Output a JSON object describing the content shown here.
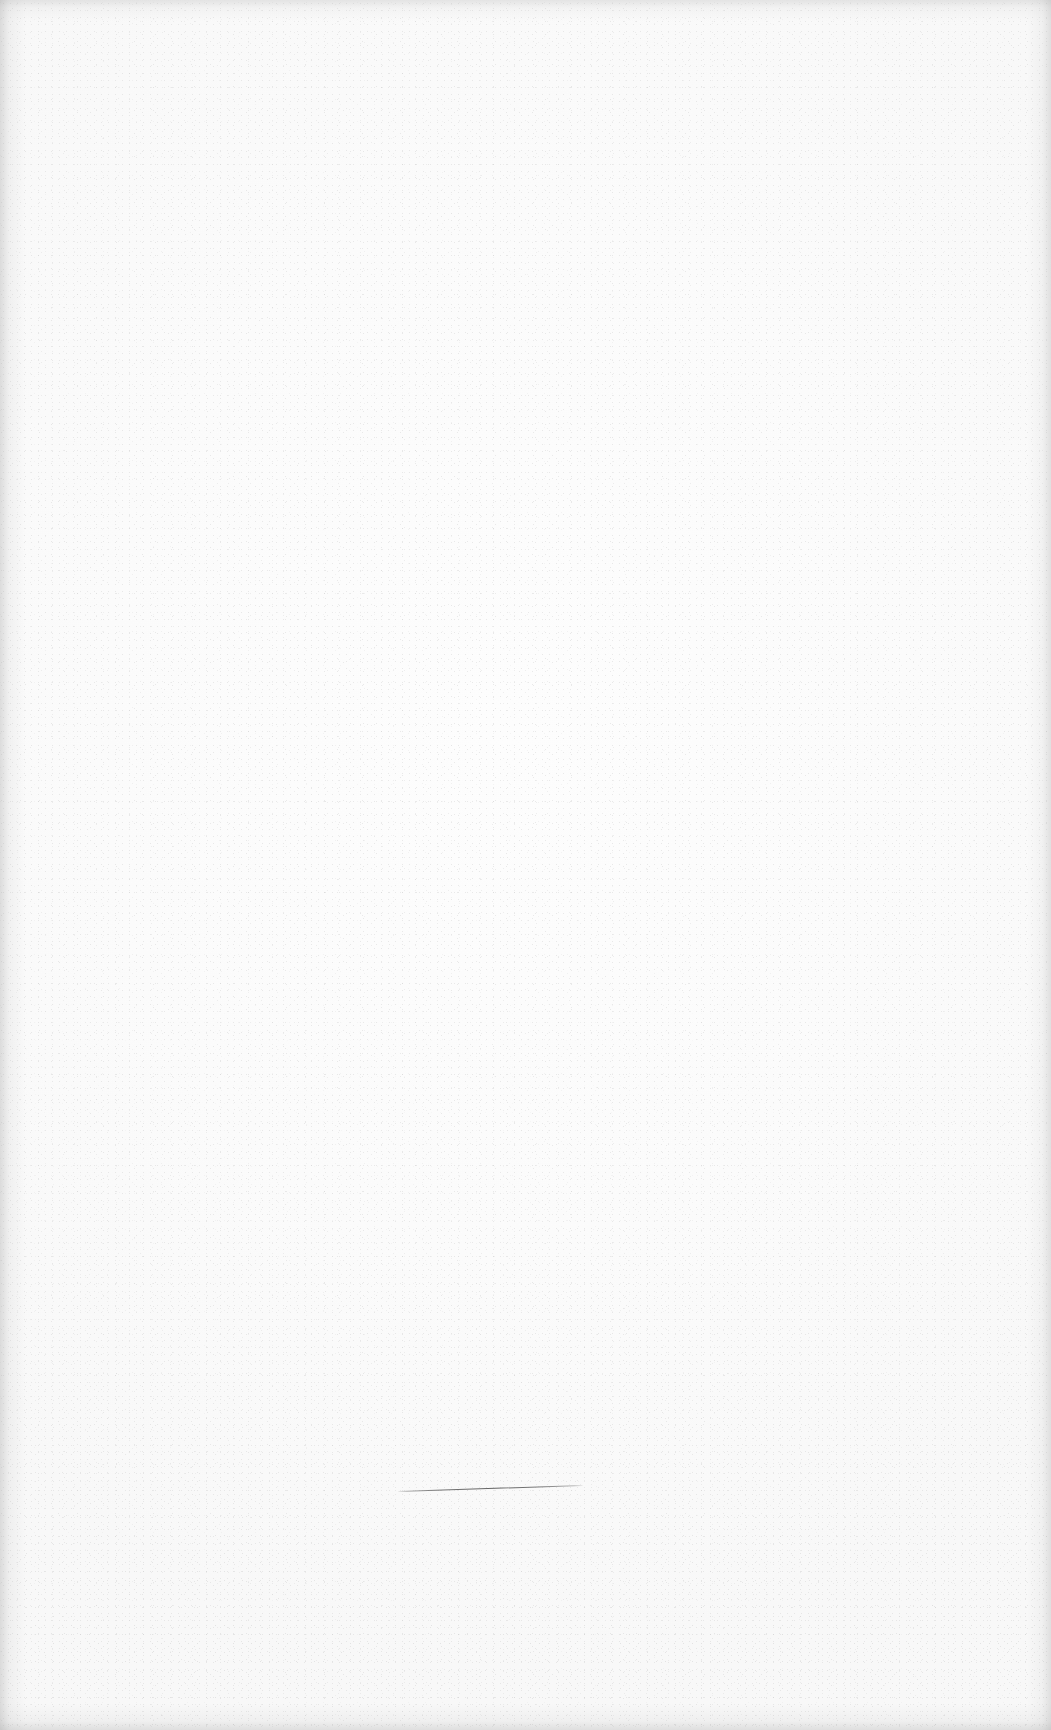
{
  "document": {
    "kind": "scanned-blank-page",
    "orientation": "portrait",
    "width_px": 1051,
    "height_px": 1730,
    "text_content": "",
    "notes": "Blank scanned sheet — no printed text, headings, figures or captions are visible anywhere on the page."
  },
  "background": {
    "paper_color": "#fbfbfb",
    "paper_highlight": "#fdfdfd",
    "paper_shadow": "#f8f8f8",
    "texture": "fine random speckle / scanner grain",
    "speckle_color": "#d4d4d4"
  },
  "vignette": {
    "edge_shadow_color": "#969696",
    "left_band_px": 14,
    "right_band_px": 12,
    "top_band_px": 12,
    "bottom_band_px": 11
  },
  "marks": [
    {
      "id": "rule-line",
      "label": "horizontal rule line",
      "shape": "line",
      "color": "#646464",
      "x_start": 398,
      "y_start": 1492,
      "x_end": 583,
      "y_end": 1486,
      "length_px": 185,
      "thickness_px": 1.4,
      "angle_deg": -1.9,
      "description": "Thin, faint, slightly upward-tilted horizontal ruled line in the lower-middle of the sheet, left of center."
    }
  ]
}
